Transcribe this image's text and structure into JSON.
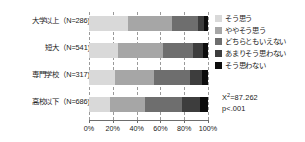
{
  "chart_data": {
    "type": "bar",
    "orientation": "horizontal",
    "stacked": true,
    "normalized_percent": true,
    "title": "",
    "xlabel": "",
    "ylabel": "",
    "xlim": [
      0,
      100
    ],
    "grid": true,
    "grid_axis": "x",
    "grid_style": "dashed",
    "legend_position": "right",
    "categories": [
      "大学以上（N=286)",
      "短大（N=541)",
      "専門学校（N=317)",
      "高校以下（N=686)"
    ],
    "category_names": [
      "大学以上",
      "短大",
      "専門学校",
      "高校以下"
    ],
    "category_n": [
      286,
      541,
      317,
      686
    ],
    "tick_labels": [
      "0%",
      "20%",
      "40%",
      "60%",
      "80%",
      "100%"
    ],
    "tick_values": [
      0,
      20,
      40,
      60,
      80,
      100
    ],
    "series": [
      {
        "name": "そう思う",
        "color": "#d9d9d9",
        "values": [
          33,
          24,
          22,
          18
        ]
      },
      {
        "name": "ややそう思う",
        "color": "#a6a6a6",
        "values": [
          37,
          38,
          33,
          29
        ]
      },
      {
        "name": "どちらともいえない",
        "color": "#6e6e6e",
        "values": [
          22,
          25,
          30,
          31
        ]
      },
      {
        "name": "あまりそう思わない",
        "color": "#3d3d3d",
        "values": [
          5,
          9,
          10,
          15
        ]
      },
      {
        "name": "そう思わない",
        "color": "#0d0d0d",
        "values": [
          3,
          4,
          5,
          7
        ]
      }
    ],
    "annotations": {
      "chi_square_label": "X",
      "chi_square_sup": "2",
      "chi_square_value": "=87.262",
      "p_value": "p<.001"
    }
  }
}
